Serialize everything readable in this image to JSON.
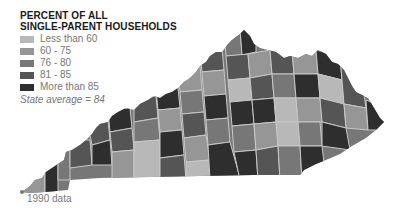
{
  "title_lines": [
    "PERCENT OF ALL",
    "SINGLE-PARENT HOUSEHOLDS"
  ],
  "legend": [
    {
      "label": "Less than 60",
      "color": "#b8b8b8"
    },
    {
      "label": "60 - 75",
      "color": "#969696"
    },
    {
      "label": "76 - 80",
      "color": "#777777"
    },
    {
      "label": "81 - 85",
      "color": "#555555"
    },
    {
      "label": "More than 85",
      "color": "#2e2e2e"
    }
  ],
  "state_average": "State average = 84",
  "footnote": "1990 data",
  "map": {
    "region": "Kentucky counties",
    "border_color": "#c8c8c8"
  }
}
